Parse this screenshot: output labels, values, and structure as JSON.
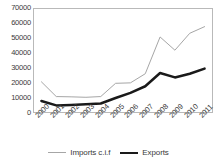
{
  "chart_data": {
    "type": "line",
    "title": "",
    "xlabel": "",
    "ylabel": "",
    "categories": [
      "2000",
      "2001",
      "2002",
      "2003",
      "2004",
      "2005",
      "2006",
      "2007",
      "2008",
      "2009",
      "2010",
      "2011"
    ],
    "series": [
      {
        "name": "Imports c.i.f",
        "color": "#a6a6a6",
        "line_width": 1,
        "values": [
          20500,
          10500,
          10300,
          10000,
          10500,
          19500,
          19800,
          26000,
          51000,
          42000,
          53500,
          58000
        ]
      },
      {
        "name": "Exports",
        "color": "#1a1a1a",
        "line_width": 2.5,
        "values": [
          7500,
          4500,
          4800,
          5300,
          5800,
          9500,
          13000,
          17500,
          26500,
          23500,
          26000,
          29500
        ]
      }
    ],
    "ylim": [
      0,
      70000
    ],
    "ytick_step": 10000,
    "yticks": [
      "0",
      "10000",
      "20000",
      "30000",
      "40000",
      "50000",
      "60000",
      "70000"
    ],
    "grid": false,
    "legend_position": "bottom"
  },
  "legend": {
    "items": [
      {
        "label": "Imports c.i.f",
        "swatch": "imports"
      },
      {
        "label": "Exports",
        "swatch": "exports"
      }
    ]
  }
}
